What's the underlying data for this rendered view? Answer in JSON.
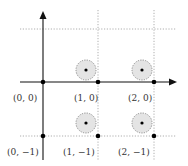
{
  "diagram": {
    "type": "lattice",
    "colors": {
      "axis": "#111111",
      "grid": "#9a9a9a",
      "circle_fill": "#e4e4e4",
      "circle_stroke": "#777777",
      "point": "#000000",
      "label": "#333333"
    },
    "axes": {
      "origin_px": [
        43,
        82
      ],
      "x_axis_end_px": 176,
      "y_axis_top_px": 11
    },
    "grid_lines": {
      "vertical_x_px": [
        98,
        154
      ],
      "horizontal_y_px": [
        29,
        136
      ]
    },
    "points": [
      {
        "label": "(0, 0)",
        "px": [
          43,
          82
        ]
      },
      {
        "label": "(1, 0)",
        "px": [
          98,
          82
        ]
      },
      {
        "label": "(2, 0)",
        "px": [
          154,
          82
        ]
      },
      {
        "label": "(0, −1)",
        "px": [
          43,
          136
        ]
      },
      {
        "label": "(1, −1)",
        "px": [
          98,
          136
        ]
      },
      {
        "label": "(2, −1)",
        "px": [
          154,
          136
        ]
      }
    ],
    "shaded_circles": [
      {
        "center_px": [
          86,
          70
        ],
        "r": 10
      },
      {
        "center_px": [
          142,
          70
        ],
        "r": 10
      },
      {
        "center_px": [
          86,
          123
        ],
        "r": 10
      },
      {
        "center_px": [
          142,
          123
        ],
        "r": 10
      }
    ],
    "labels": {
      "p00": "(0, 0)",
      "p10": "(1, 0)",
      "p20": "(2, 0)",
      "p0m1": "(0, −1)",
      "p1m1": "(1, −1)",
      "p2m1": "(2, −1)"
    }
  }
}
